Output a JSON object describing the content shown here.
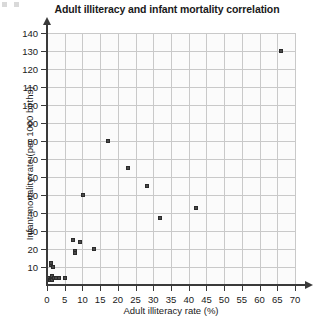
{
  "chart_data": {
    "type": "scatter",
    "title": "Adult illiteracy and infant mortality correlation",
    "xlabel": "Adult illiteracy rate (%)",
    "ylabel": "Infant mortality rate (per 1000 births)",
    "xlim": [
      0,
      70
    ],
    "ylim": [
      0,
      140
    ],
    "xticks": [
      0,
      5,
      10,
      15,
      20,
      25,
      30,
      35,
      40,
      45,
      50,
      55,
      60,
      65,
      70
    ],
    "yticks": [
      0,
      10,
      20,
      30,
      40,
      50,
      60,
      70,
      80,
      90,
      100,
      110,
      120,
      130,
      140
    ],
    "grid": true,
    "legend": "none",
    "marker_color": "#4a4a4a",
    "series": [
      {
        "name": "Countries",
        "points": [
          [
            0.6,
            4
          ],
          [
            0.8,
            3
          ],
          [
            1.0,
            11
          ],
          [
            1.0,
            12
          ],
          [
            1.2,
            4
          ],
          [
            1.4,
            5
          ],
          [
            1.5,
            3
          ],
          [
            1.6,
            10
          ],
          [
            2.0,
            4
          ],
          [
            2.4,
            4
          ],
          [
            3.4,
            4
          ],
          [
            5.0,
            4
          ],
          [
            7.2,
            25
          ],
          [
            7.8,
            19
          ],
          [
            7.8,
            18
          ],
          [
            9.2,
            24
          ],
          [
            10.3,
            50
          ],
          [
            13.4,
            20
          ],
          [
            17.2,
            80
          ],
          [
            23.0,
            65
          ],
          [
            28.2,
            55
          ],
          [
            32.0,
            37
          ],
          [
            42.0,
            43
          ],
          [
            66.0,
            130
          ]
        ]
      }
    ]
  }
}
